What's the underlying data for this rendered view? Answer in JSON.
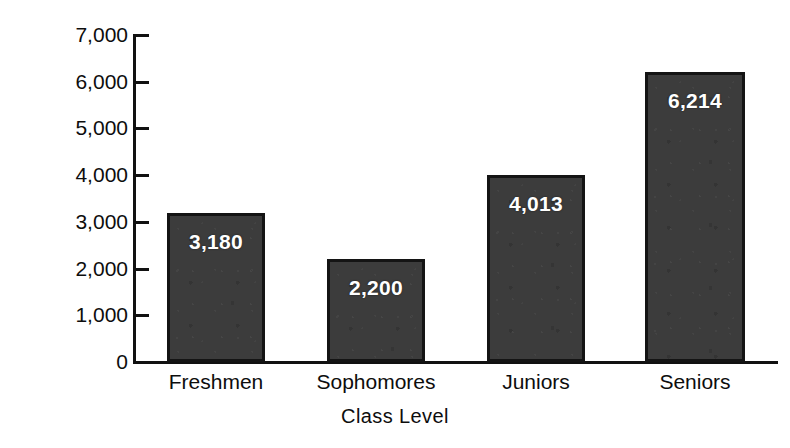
{
  "chart_data": {
    "type": "bar",
    "title": "",
    "xlabel": "Class Level",
    "ylabel": "Number of Students",
    "categories": [
      "Freshmen",
      "Sophomores",
      "Juniors",
      "Seniors"
    ],
    "values": [
      3180,
      2200,
      4013,
      6214
    ],
    "value_labels": [
      "3,180",
      "2,200",
      "4,013",
      "6,214"
    ],
    "ylim": [
      0,
      7000
    ],
    "ytick_values": [
      0,
      1000,
      2000,
      3000,
      4000,
      5000,
      6000,
      7000
    ],
    "ytick_labels": [
      "0",
      "1,000",
      "2,000",
      "3,000",
      "4,000",
      "5,000",
      "6,000",
      "7,000"
    ],
    "grid": false,
    "legend": false,
    "bar_color": "#3c3c3c",
    "bar_border_color": "#141414",
    "value_label_color": "#ffffff",
    "axis_color": "#111111",
    "background_color": "#ffffff"
  },
  "axes": {
    "y_title": "Number of Students",
    "x_title": "Class Level"
  },
  "ticks": {
    "y": [
      {
        "label": "7,000",
        "value": 7000
      },
      {
        "label": "6,000",
        "value": 6000
      },
      {
        "label": "5,000",
        "value": 5000
      },
      {
        "label": "4,000",
        "value": 4000
      },
      {
        "label": "3,000",
        "value": 3000
      },
      {
        "label": "2,000",
        "value": 2000
      },
      {
        "label": "1,000",
        "value": 1000
      },
      {
        "label": "0",
        "value": 0
      }
    ]
  },
  "bars": [
    {
      "category": "Freshmen",
      "value": 3180,
      "label": "3,180"
    },
    {
      "category": "Sophomores",
      "value": 2200,
      "label": "2,200"
    },
    {
      "category": "Juniors",
      "value": 4013,
      "label": "4,013"
    },
    {
      "category": "Seniors",
      "value": 6214,
      "label": "6,214"
    }
  ]
}
